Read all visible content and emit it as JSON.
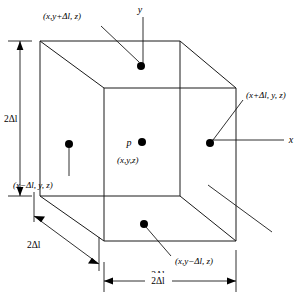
{
  "figure": {
    "line_color": "#1a1a1a",
    "dot_color": "#000000",
    "background": "#ffffff"
  },
  "axes": {
    "y_label": "y",
    "x_label": "x"
  },
  "center_point": {
    "marker_label": "p",
    "coordinate_label": "(x,y,z)"
  },
  "neighbors": {
    "top": "(x,y+Δl, z)",
    "right": "(x+Δl, y, z)",
    "left": "(x−Δl, y, z)",
    "bottom": "(x,y−Δl, z)"
  },
  "dimensions": {
    "height": "2Δl",
    "depth": "2Δl",
    "width": "2Δl"
  }
}
